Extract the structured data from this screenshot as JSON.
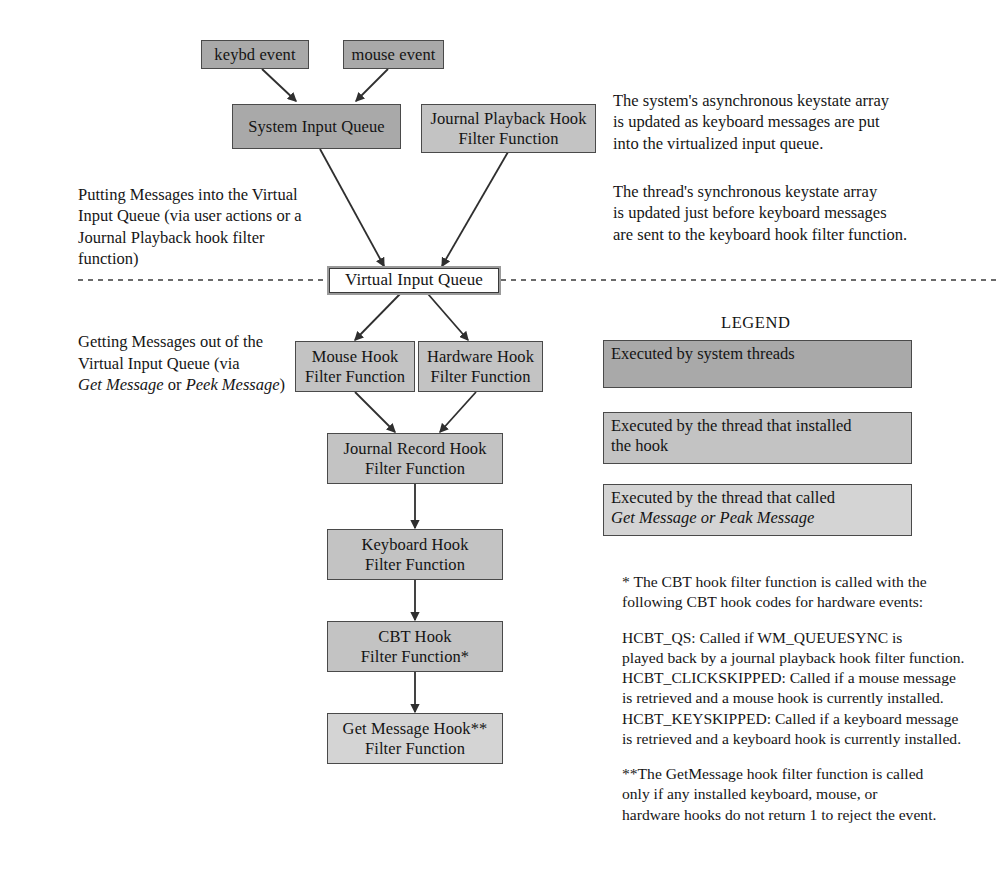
{
  "diagram": {
    "colors": {
      "system_threads_fill": "#a9a9a9",
      "installing_thread_fill": "#c3c3c3",
      "calling_thread_fill": "#d4d4d4",
      "queue_fill": "#ffffff",
      "line": "#3a3a3a",
      "text": "#141414",
      "background": "#ffffff"
    },
    "nodes": [
      {
        "id": "keybd-event",
        "label_lines": [
          "keybd event"
        ],
        "fill": "system"
      },
      {
        "id": "mouse-event",
        "label_lines": [
          "mouse event"
        ],
        "fill": "system"
      },
      {
        "id": "system-input-queue",
        "label_lines": [
          "System Input Queue"
        ],
        "fill": "system"
      },
      {
        "id": "journal-playback-hook",
        "label_lines": [
          "Journal Playback Hook",
          "Filter Function"
        ],
        "fill": "hook"
      },
      {
        "id": "virtual-input-queue",
        "label_lines": [
          "Virtual Input Queue"
        ],
        "fill": "none"
      },
      {
        "id": "mouse-hook",
        "label_lines": [
          "Mouse Hook",
          "Filter Function"
        ],
        "fill": "hook"
      },
      {
        "id": "hardware-hook",
        "label_lines": [
          "Hardware Hook",
          "Filter Function"
        ],
        "fill": "hook"
      },
      {
        "id": "journal-record-hook",
        "label_lines": [
          "Journal Record Hook",
          "Filter Function"
        ],
        "fill": "hook"
      },
      {
        "id": "keyboard-hook",
        "label_lines": [
          "Keyboard Hook",
          "Filter Function"
        ],
        "fill": "hook"
      },
      {
        "id": "cbt-hook",
        "label_lines": [
          "CBT Hook",
          "Filter Function*"
        ],
        "fill": "hook"
      },
      {
        "id": "get-message-hook",
        "label_lines": [
          "Get Message Hook**",
          "Filter Function"
        ],
        "fill": "caller"
      }
    ],
    "annotations": {
      "putting_messages": "Putting Messages into the Virtual\nInput Queue (via user actions or a\nJournal Playback hook filter\nfunction)",
      "getting_messages_line1": "Getting Messages out of the",
      "getting_messages_line2": "Virtual Input Queue (via",
      "getting_messages_line3_pre": "",
      "getting_messages_italic_a": "Get Message",
      "getting_messages_mid": " or ",
      "getting_messages_italic_b": "Peek Message",
      "getting_messages_line3_post": ")",
      "async_keystate": "The system's asynchronous keystate array\nis updated as keyboard messages are put\ninto the virtualized input queue.",
      "sync_keystate": "The thread's synchronous keystate array\nis updated just before keyboard messages\nare sent to the keyboard hook filter function."
    },
    "legend": {
      "title": "LEGEND",
      "entries": [
        {
          "id": "legend-system-threads",
          "lines": [
            "Executed by system threads"
          ],
          "fill": "system"
        },
        {
          "id": "legend-installing-thread",
          "lines": [
            "Executed by the thread that installed",
            "the hook"
          ],
          "fill": "hook"
        },
        {
          "id": "legend-calling-thread",
          "lines": [
            "Executed by the thread that called"
          ],
          "italic_line": "Get Message or Peak Message",
          "fill": "caller"
        }
      ]
    },
    "footnotes": {
      "single_star": "* The CBT hook filter function is called with the\nfollowing CBT hook codes for hardware events:",
      "codes": "HCBT_QS: Called if WM_QUEUESYNC is\nplayed back by a journal playback hook filter function.\nHCBT_CLICKSKIPPED: Called if a mouse message\nis retrieved and a mouse hook is currently installed.\nHCBT_KEYSKIPPED: Called if a keyboard message\nis retrieved and a keyboard hook is currently installed.",
      "double_star": "**The GetMessage hook filter function is called\nonly if any installed keyboard, mouse, or\nhardware hooks do not return 1 to reject the event."
    }
  }
}
